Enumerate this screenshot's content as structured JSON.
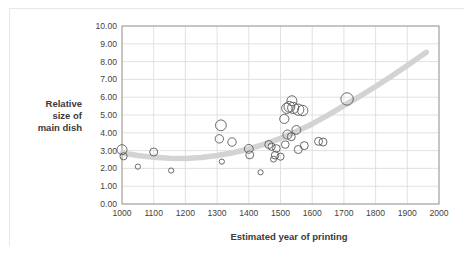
{
  "chart_data": {
    "type": "scatter",
    "title": "",
    "xlabel": "Estimated year of printing",
    "ylabel": "Relative size of main dish",
    "ylabel_lines": [
      "Relative",
      "size of",
      "main dish"
    ],
    "xlim": [
      1000,
      2000
    ],
    "ylim": [
      0.0,
      10.0
    ],
    "xticks": [
      1000,
      1100,
      1200,
      1300,
      1400,
      1500,
      1600,
      1700,
      1800,
      1900,
      2000
    ],
    "xtick_labels": [
      "1000",
      "1100",
      "1200",
      "1300",
      "1400",
      "1500",
      "1600",
      "1700",
      "1800",
      "1900",
      "2000"
    ],
    "yticks": [
      0.0,
      1.0,
      2.0,
      3.0,
      4.0,
      5.0,
      6.0,
      7.0,
      8.0,
      9.0,
      10.0
    ],
    "ytick_labels": [
      "0.00",
      "1.00",
      "2.00",
      "3.00",
      "4.00",
      "5.00",
      "6.00",
      "7.00",
      "8.00",
      "9.00",
      "10.00"
    ],
    "grid": true,
    "grid_color": "#d9d9d9",
    "legend": "none",
    "marker_style": "open-circle",
    "marker_edge_color": "#5a5a5a",
    "marker_fill": "none",
    "points": [
      {
        "x": 1000,
        "y": 3.05,
        "r": 5.0
      },
      {
        "x": 1005,
        "y": 2.68,
        "r": 3.6
      },
      {
        "x": 1050,
        "y": 2.1,
        "r": 2.6
      },
      {
        "x": 1100,
        "y": 2.92,
        "r": 4.0
      },
      {
        "x": 1155,
        "y": 1.88,
        "r": 2.6
      },
      {
        "x": 1312,
        "y": 4.42,
        "r": 5.4
      },
      {
        "x": 1307,
        "y": 3.66,
        "r": 4.2
      },
      {
        "x": 1347,
        "y": 3.48,
        "r": 4.2
      },
      {
        "x": 1315,
        "y": 2.38,
        "r": 2.6
      },
      {
        "x": 1400,
        "y": 3.1,
        "r": 4.4
      },
      {
        "x": 1403,
        "y": 2.76,
        "r": 4.0
      },
      {
        "x": 1437,
        "y": 1.78,
        "r": 2.6
      },
      {
        "x": 1463,
        "y": 3.34,
        "r": 4.0
      },
      {
        "x": 1472,
        "y": 3.22,
        "r": 3.6
      },
      {
        "x": 1487,
        "y": 3.12,
        "r": 3.8
      },
      {
        "x": 1483,
        "y": 2.74,
        "r": 3.8
      },
      {
        "x": 1478,
        "y": 2.52,
        "r": 3.0
      },
      {
        "x": 1500,
        "y": 2.66,
        "r": 3.6
      },
      {
        "x": 1512,
        "y": 4.78,
        "r": 4.6
      },
      {
        "x": 1520,
        "y": 5.38,
        "r": 5.2
      },
      {
        "x": 1528,
        "y": 5.46,
        "r": 5.4
      },
      {
        "x": 1536,
        "y": 5.8,
        "r": 5.0
      },
      {
        "x": 1540,
        "y": 5.4,
        "r": 5.6
      },
      {
        "x": 1556,
        "y": 5.3,
        "r": 5.6
      },
      {
        "x": 1570,
        "y": 5.25,
        "r": 5.2
      },
      {
        "x": 1522,
        "y": 3.9,
        "r": 4.6
      },
      {
        "x": 1534,
        "y": 3.78,
        "r": 4.0
      },
      {
        "x": 1550,
        "y": 4.16,
        "r": 4.4
      },
      {
        "x": 1515,
        "y": 3.34,
        "r": 3.8
      },
      {
        "x": 1556,
        "y": 3.06,
        "r": 4.0
      },
      {
        "x": 1575,
        "y": 3.28,
        "r": 4.0
      },
      {
        "x": 1620,
        "y": 3.52,
        "r": 4.0
      },
      {
        "x": 1634,
        "y": 3.48,
        "r": 4.0
      },
      {
        "x": 1710,
        "y": 5.9,
        "r": 6.2
      }
    ],
    "trend": {
      "type": "polynomial",
      "color": "#d3d3d3",
      "width": 5.5,
      "points": [
        {
          "x": 1000,
          "y": 2.86
        },
        {
          "x": 1050,
          "y": 2.72
        },
        {
          "x": 1100,
          "y": 2.62
        },
        {
          "x": 1150,
          "y": 2.57
        },
        {
          "x": 1200,
          "y": 2.56
        },
        {
          "x": 1250,
          "y": 2.61
        },
        {
          "x": 1300,
          "y": 2.72
        },
        {
          "x": 1350,
          "y": 2.88
        },
        {
          "x": 1400,
          "y": 3.09
        },
        {
          "x": 1450,
          "y": 3.36
        },
        {
          "x": 1500,
          "y": 3.69
        },
        {
          "x": 1550,
          "y": 4.07
        },
        {
          "x": 1600,
          "y": 4.5
        },
        {
          "x": 1650,
          "y": 4.99
        },
        {
          "x": 1700,
          "y": 5.53
        },
        {
          "x": 1750,
          "y": 6.05
        },
        {
          "x": 1800,
          "y": 6.6
        },
        {
          "x": 1850,
          "y": 7.18
        },
        {
          "x": 1900,
          "y": 7.78
        },
        {
          "x": 1960,
          "y": 8.52
        }
      ]
    }
  }
}
